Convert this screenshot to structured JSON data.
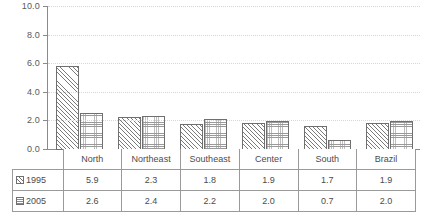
{
  "chart_data": {
    "type": "bar",
    "title": "",
    "xlabel": "",
    "ylabel": "",
    "categories": [
      "North",
      "Northeast",
      "Southeast",
      "Center",
      "South",
      "Brazil"
    ],
    "series": [
      {
        "name": "1995",
        "values": [
          5.9,
          2.3,
          1.8,
          1.9,
          1.7,
          1.9
        ],
        "pattern": "diagonal-hatch"
      },
      {
        "name": "2005",
        "values": [
          2.6,
          2.4,
          2.2,
          2.0,
          0.7,
          2.0
        ],
        "pattern": "grid-hatch"
      }
    ],
    "ylim": [
      0.0,
      10.0
    ],
    "ytick_labels": [
      "10.0",
      "8.0",
      "6.0",
      "4.0",
      "2.0",
      "0.0"
    ],
    "ytick_values": [
      10.0,
      8.0,
      6.0,
      4.0,
      2.0,
      0.0
    ],
    "grid": true,
    "grid_style": "dotted-horizontal",
    "legend_position": "data-table-left-column",
    "colors": {
      "axis": "#8a8a8a",
      "gridline": "#d7d7d7",
      "bar_outline": "#6f6f6f",
      "text": "#4b4b4b",
      "table_border": "#9a9a9a",
      "background": "#ffffff"
    }
  },
  "table": {
    "column_headers": [
      "North",
      "Northeast",
      "Southeast",
      "Center",
      "South",
      "Brazil"
    ],
    "rows": [
      {
        "label": "1995",
        "values": [
          "5.9",
          "2.3",
          "1.8",
          "1.9",
          "1.7",
          "1.9"
        ]
      },
      {
        "label": "2005",
        "values": [
          "2.6",
          "2.4",
          "2.2",
          "2.0",
          "0.7",
          "2.0"
        ]
      }
    ]
  }
}
